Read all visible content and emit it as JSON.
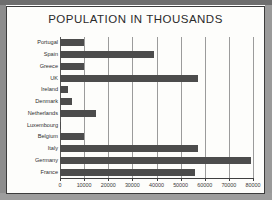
{
  "chart_data": {
    "type": "bar",
    "orientation": "horizontal",
    "title": "POPULATION IN THOUSANDS",
    "xlabel": "",
    "ylabel": "",
    "xlim": [
      0,
      80000
    ],
    "grid": true,
    "legend": false,
    "bar_color": "#4c4c4c",
    "xticks": [
      0,
      10000,
      20000,
      30000,
      40000,
      50000,
      60000,
      70000,
      80000
    ],
    "xtick_labels": [
      "0",
      "10000",
      "20000",
      "30000",
      "40000",
      "50000",
      "60000",
      "70000",
      "80000"
    ],
    "categories": [
      "Portugal",
      "Spain",
      "Greece",
      "UK",
      "Ireland",
      "Denmark",
      "Netherlands",
      "Luxembourg",
      "Belgium",
      "Italy",
      "Germany",
      "France"
    ],
    "values": [
      10000,
      39000,
      10000,
      57000,
      3500,
      5000,
      15000,
      400,
      10000,
      57000,
      79000,
      56000
    ]
  }
}
